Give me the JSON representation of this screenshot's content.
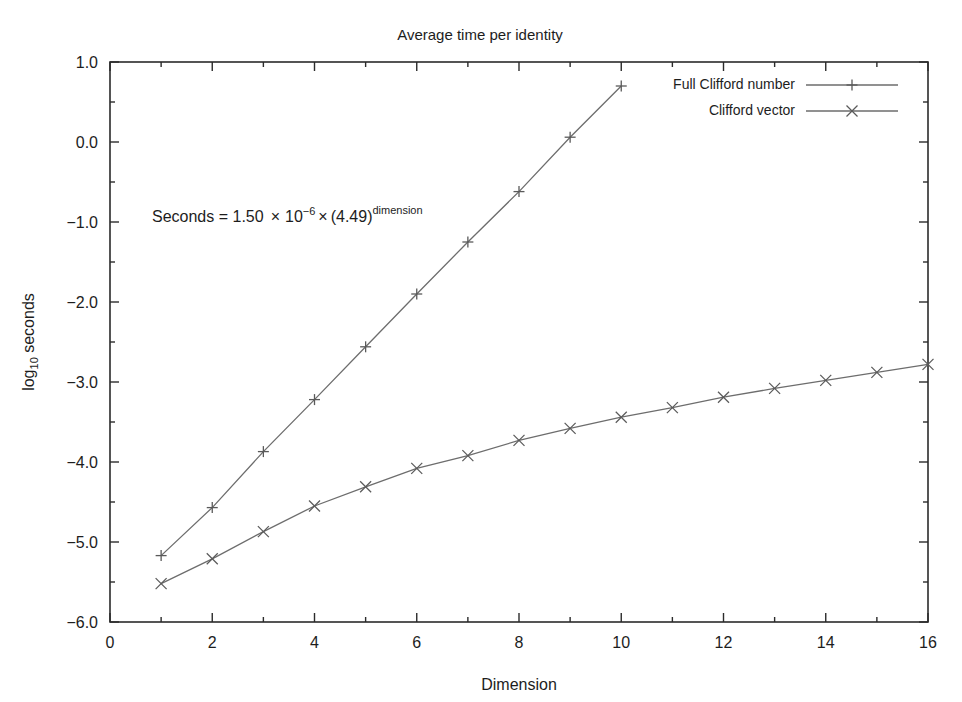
{
  "chart_data": {
    "type": "line",
    "title": "Average time per identity",
    "xlabel": "Dimension",
    "ylabel_main": "log",
    "ylabel_sub": "10",
    "ylabel_rest": " seconds",
    "ylabel": "log10 seconds",
    "xlim": [
      0,
      16
    ],
    "ylim": [
      -6.0,
      1.0
    ],
    "xticks": [
      0,
      2,
      4,
      6,
      8,
      10,
      12,
      14,
      16
    ],
    "xtick_labels": [
      "0",
      "2",
      "4",
      "6",
      "8",
      "10",
      "12",
      "14",
      "16"
    ],
    "xticks_minor": [
      1,
      3,
      5,
      7,
      9,
      11,
      13,
      15
    ],
    "yticks": [
      1.0,
      0.0,
      -1.0,
      -2.0,
      -3.0,
      -4.0,
      -5.0,
      -6.0
    ],
    "ytick_labels": [
      "1.0",
      "0.0",
      "−1.0",
      "−2.0",
      "−3.0",
      "−4.0",
      "−5.0",
      "−6.0"
    ],
    "grid": false,
    "legend_position": "top-right-inside",
    "annotation": {
      "text": "Seconds = 1.50 × 10−6 × (4.49)dimension",
      "parts": {
        "lead": "Seconds = 1.50",
        "times1": "×",
        "base": "10",
        "exp": "−6",
        "times2": "×",
        "paren": "(4.49)",
        "power": "dimension"
      },
      "x_data": 0.85,
      "y_data": -1.08
    },
    "series": [
      {
        "name": "Full Clifford number",
        "marker": "plus",
        "color": "#6d6d6d",
        "x": [
          1,
          2,
          3,
          4,
          5,
          6,
          7,
          8,
          9,
          10
        ],
        "values": [
          -5.17,
          -4.57,
          -3.87,
          -3.22,
          -2.56,
          -1.9,
          -1.25,
          -0.62,
          0.06,
          0.7
        ]
      },
      {
        "name": "Clifford vector",
        "marker": "cross",
        "color": "#6d6d6d",
        "x": [
          1,
          2,
          3,
          4,
          5,
          6,
          7,
          8,
          9,
          10,
          11,
          12,
          13,
          14,
          15,
          16
        ],
        "values": [
          -5.52,
          -5.21,
          -4.87,
          -4.55,
          -4.31,
          -4.08,
          -3.92,
          -3.73,
          -3.58,
          -3.44,
          -3.32,
          -3.19,
          -3.08,
          -2.98,
          -2.88,
          -2.78
        ]
      }
    ]
  }
}
